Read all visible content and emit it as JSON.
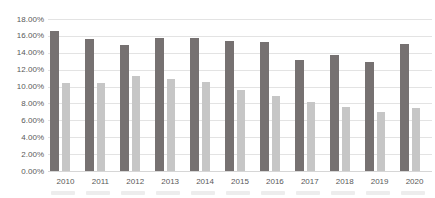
{
  "chart_data": {
    "type": "bar",
    "title": "",
    "categories": [
      "2010",
      "2011",
      "2012",
      "2013",
      "2014",
      "2015",
      "2016",
      "2017",
      "2018",
      "2019",
      "2020"
    ],
    "series": [
      {
        "name": "series-dark-gray",
        "color": "#767171",
        "values": [
          16.6,
          15.6,
          14.9,
          15.8,
          15.7,
          15.4,
          15.3,
          13.2,
          13.7,
          12.9,
          15.0
        ]
      },
      {
        "name": "series-light-gray",
        "color": "#c6c6c6",
        "values": [
          10.4,
          10.4,
          11.2,
          10.9,
          10.5,
          9.6,
          8.9,
          8.2,
          7.6,
          7.0,
          7.5
        ]
      }
    ],
    "ylim": [
      0,
      18
    ],
    "ytick_step": 2,
    "yticks": [
      "18.00%",
      "16.00%",
      "14.00%",
      "12.00%",
      "10.00%",
      "8.00%",
      "6.00%",
      "4.00%",
      "2.00%",
      "0.00%"
    ],
    "xlabel": "",
    "ylabel": "",
    "grid": true,
    "legend_position": "none"
  },
  "colors": {
    "background": "#ffffff",
    "grid": "#e3e3e3",
    "axis_line": "#d6d6d6",
    "tick_text": "#595959",
    "bottom_strip": "#ededed"
  }
}
